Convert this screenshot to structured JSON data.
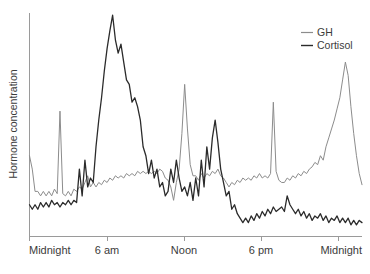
{
  "chart_data": {
    "type": "line",
    "title": "",
    "xlabel": "",
    "ylabel": "Hormone concentration",
    "grid": false,
    "legend_position": "top-right",
    "x_tick_labels": [
      "Midnight",
      "6 am",
      "Noon",
      "6 pm",
      "Midnight"
    ],
    "x_tick_values": [
      0,
      6,
      12,
      18,
      24
    ],
    "xlim": [
      0,
      24
    ],
    "ylim": [
      0,
      100
    ],
    "y_tick_labels": [],
    "series": [
      {
        "name": "GH",
        "color": "#8c8c8c",
        "x": [
          0.0,
          0.2,
          0.4,
          0.6,
          0.8,
          1.0,
          1.2,
          1.4,
          1.6,
          1.8,
          2.0,
          2.2,
          2.4,
          2.6,
          2.8,
          3.0,
          3.2,
          3.4,
          3.6,
          3.8,
          4.0,
          4.2,
          4.4,
          4.6,
          4.8,
          5.0,
          5.2,
          5.4,
          5.6,
          5.8,
          6.0,
          6.2,
          6.4,
          6.6,
          6.8,
          7.0,
          7.2,
          7.4,
          7.6,
          7.8,
          8.0,
          8.2,
          8.4,
          8.6,
          8.8,
          9.0,
          9.2,
          9.4,
          9.6,
          9.8,
          10.0,
          10.2,
          10.4,
          10.6,
          10.8,
          11.0,
          11.2,
          11.4,
          11.6,
          11.8,
          12.0,
          12.2,
          12.4,
          12.6,
          12.8,
          13.0,
          13.2,
          13.4,
          13.6,
          13.8,
          14.0,
          14.2,
          14.4,
          14.6,
          14.8,
          15.0,
          15.2,
          15.4,
          15.6,
          15.8,
          16.0,
          16.2,
          16.4,
          16.6,
          16.8,
          17.0,
          17.2,
          17.4,
          17.6,
          17.8,
          18.0,
          18.2,
          18.4,
          18.6,
          18.8,
          19.0,
          19.2,
          19.4,
          19.6,
          19.8,
          20.0,
          20.2,
          20.4,
          20.6,
          20.8,
          21.0,
          21.2,
          21.4,
          21.6,
          21.8,
          22.0,
          22.2,
          22.4,
          22.6,
          22.8,
          23.0,
          23.2,
          23.4,
          23.6,
          23.8,
          24.0
        ],
        "y": [
          36,
          30,
          20,
          20,
          18,
          20,
          18,
          20,
          18,
          21,
          19,
          56,
          19,
          18,
          20,
          18,
          21,
          20,
          22,
          21,
          24,
          27,
          22,
          24,
          22,
          24,
          23,
          25,
          24,
          26,
          25,
          27,
          26,
          27,
          26,
          28,
          27,
          28,
          27,
          29,
          28,
          29,
          28,
          29,
          28,
          29,
          28,
          30,
          29,
          26,
          25,
          22,
          16,
          24,
          30,
          46,
          68,
          48,
          32,
          27,
          27,
          25,
          28,
          26,
          28,
          27,
          29,
          28,
          30,
          27,
          26,
          24,
          22,
          24,
          23,
          25,
          24,
          26,
          25,
          26,
          25,
          27,
          26,
          28,
          26,
          27,
          26,
          28,
          60,
          29,
          25,
          24,
          24,
          26,
          25,
          27,
          26,
          28,
          27,
          29,
          28,
          30,
          31,
          33,
          32,
          36,
          34,
          40,
          44,
          48,
          52,
          57,
          62,
          70,
          78,
          72,
          58,
          46,
          36,
          28,
          23
        ],
        "note": "Growth hormone: low pulsatile baseline during day with sharp secretory pulses, large surge during early-night slow-wave sleep"
      },
      {
        "name": "Cortisol",
        "color": "#2b2b2b",
        "x": [
          0.0,
          0.2,
          0.4,
          0.6,
          0.8,
          1.0,
          1.2,
          1.4,
          1.6,
          1.8,
          2.0,
          2.2,
          2.4,
          2.6,
          2.8,
          3.0,
          3.2,
          3.4,
          3.6,
          3.8,
          4.0,
          4.2,
          4.4,
          4.6,
          4.8,
          5.0,
          5.2,
          5.4,
          5.6,
          5.8,
          6.0,
          6.2,
          6.4,
          6.6,
          6.8,
          7.0,
          7.2,
          7.4,
          7.6,
          7.8,
          8.0,
          8.2,
          8.4,
          8.6,
          8.8,
          9.0,
          9.2,
          9.4,
          9.6,
          9.8,
          10.0,
          10.2,
          10.4,
          10.6,
          10.8,
          11.0,
          11.2,
          11.4,
          11.6,
          11.8,
          12.0,
          12.2,
          12.4,
          12.6,
          12.8,
          13.0,
          13.2,
          13.4,
          13.6,
          13.8,
          14.0,
          14.2,
          14.4,
          14.6,
          14.8,
          15.0,
          15.2,
          15.4,
          15.6,
          15.8,
          16.0,
          16.2,
          16.4,
          16.6,
          16.8,
          17.0,
          17.2,
          17.4,
          17.6,
          17.8,
          18.0,
          18.2,
          18.4,
          18.6,
          18.8,
          19.0,
          19.2,
          19.4,
          19.6,
          19.8,
          20.0,
          20.2,
          20.4,
          20.6,
          20.8,
          21.0,
          21.2,
          21.4,
          21.6,
          21.8,
          22.0,
          22.2,
          22.4,
          22.6,
          22.8,
          23.0,
          23.2,
          23.4,
          23.6,
          23.8,
          24.0
        ],
        "y": [
          14,
          12,
          14,
          12,
          15,
          13,
          15,
          13,
          16,
          14,
          15,
          13,
          15,
          14,
          16,
          14,
          16,
          15,
          30,
          18,
          34,
          22,
          26,
          24,
          40,
          52,
          62,
          74,
          84,
          92,
          99,
          88,
          82,
          86,
          78,
          70,
          68,
          60,
          62,
          58,
          52,
          40,
          36,
          28,
          34,
          26,
          30,
          22,
          24,
          18,
          20,
          30,
          24,
          34,
          26,
          20,
          22,
          18,
          24,
          16,
          26,
          18,
          34,
          22,
          40,
          30,
          44,
          52,
          42,
          30,
          24,
          18,
          20,
          12,
          14,
          10,
          8,
          6,
          8,
          6,
          9,
          7,
          10,
          8,
          11,
          9,
          12,
          10,
          13,
          11,
          12,
          13,
          11,
          18,
          14,
          12,
          10,
          12,
          9,
          11,
          8,
          10,
          7,
          9,
          8,
          10,
          7,
          9,
          6,
          8,
          7,
          9,
          6,
          8,
          6,
          8,
          5,
          7,
          5,
          7,
          6
        ],
        "note": "Cortisol: nadir near midnight, steep rise peaking shortly after 6 am, declining through afternoon to low evening levels"
      }
    ],
    "annotations": []
  },
  "legend": {
    "items": [
      {
        "label": "GH",
        "color": "#8c8c8c"
      },
      {
        "label": "Cortisol",
        "color": "#2b2b2b"
      }
    ]
  },
  "axes": {
    "y_title": "Hormone concentration",
    "x_ticks": [
      {
        "label": "Midnight"
      },
      {
        "label": "6 am"
      },
      {
        "label": "Noon"
      },
      {
        "label": "6 pm"
      },
      {
        "label": "Midnight"
      }
    ],
    "axis_color": "#9a9a9a"
  }
}
